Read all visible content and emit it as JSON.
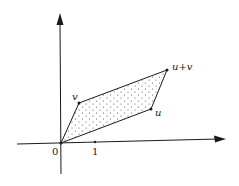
{
  "diagram": {
    "axes": {
      "origin_label": "0",
      "x_tick_label": "1"
    },
    "points": {
      "v": "v",
      "u": "u",
      "u_plus_v": "u+v"
    },
    "colors": {
      "line": "#1a1a1a",
      "dots": "#555555",
      "background": "#ffffff"
    }
  }
}
